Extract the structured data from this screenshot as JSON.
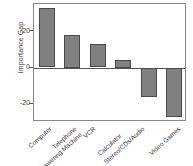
{
  "chart_data": {
    "type": "bar",
    "title": "",
    "subtitle": "",
    "xlabel": "",
    "ylabel": "Importance Gap",
    "categories": [
      "Computer",
      "Telephone Answering Machine",
      "VCR",
      "Calculator",
      "Stereo/CDs/Audio",
      "Video Games"
    ],
    "values": [
      33,
      18,
      13,
      4,
      -16,
      -27
    ],
    "ylim": [
      -30,
      35
    ],
    "yticks": [
      20,
      0,
      -20
    ],
    "ytick_labels": [
      "20",
      "0",
      "-20"
    ],
    "grid": false,
    "legend": "none",
    "bar_color": "#808080",
    "bar_edge_color": "#4a4a4a",
    "axis_color": "#8a8a8a",
    "text_color": "#3a3a3a",
    "background": "#ffffff"
  },
  "axis": {
    "y_title": "Importance Gap"
  },
  "xlabels": [
    {
      "line1": "Computer",
      "line2": ""
    },
    {
      "line1": "Telephone",
      "line2": "Answering Machine"
    },
    {
      "line1": "VCR",
      "line2": ""
    },
    {
      "line1": "Calculator",
      "line2": ""
    },
    {
      "line1": "Stereo/CDs/Audio",
      "line2": ""
    },
    {
      "line1": "Video Games",
      "line2": ""
    }
  ],
  "yticks": [
    {
      "label": "20"
    },
    {
      "label": "0"
    },
    {
      "label": "-20"
    }
  ]
}
